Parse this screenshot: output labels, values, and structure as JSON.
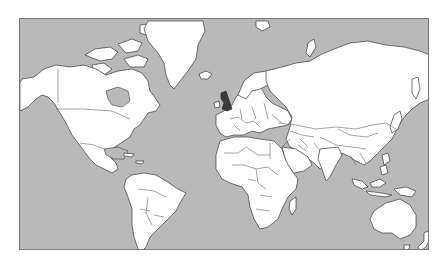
{
  "map": {
    "type": "world-political-outline",
    "projection": "Mercator",
    "colors": {
      "ocean": "#b9b9b9",
      "land": "#ffffff",
      "borders": "#3a3a3a",
      "frame": "#7a7a7a",
      "highlight": "#3c3c3c"
    },
    "highlighted_regions": [
      {
        "name": "United Kingdom",
        "color": "#3c3c3c"
      }
    ]
  }
}
